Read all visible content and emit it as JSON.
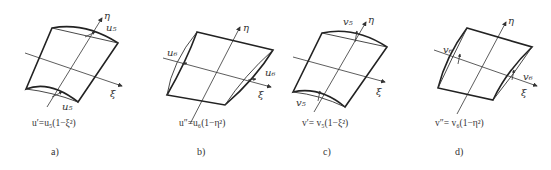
{
  "figure": {
    "panels": [
      {
        "id": "a",
        "caption": "a)",
        "formula": "u′=u₅(1−ξ²)",
        "axis_labels": {
          "eta": "η",
          "xi": "ξ"
        },
        "dof_labels": [
          "u₅",
          "u₅"
        ]
      },
      {
        "id": "b",
        "caption": "b)",
        "formula": "u″=u₆(1−η²)",
        "axis_labels": {
          "eta": "η",
          "xi": "ξ"
        },
        "dof_labels": [
          "u₆",
          "u₆"
        ]
      },
      {
        "id": "c",
        "caption": "c)",
        "formula": "v′= v₅(1−ξ²)",
        "axis_labels": {
          "eta": "η",
          "xi": "ξ"
        },
        "dof_labels": [
          "v₅",
          "v₅"
        ]
      },
      {
        "id": "d",
        "caption": "d)",
        "formula": "v″= v₆(1−η²)",
        "axis_labels": {
          "eta": "η",
          "xi": "ξ"
        },
        "dof_labels": [
          "v₆",
          "v₆"
        ]
      }
    ]
  }
}
